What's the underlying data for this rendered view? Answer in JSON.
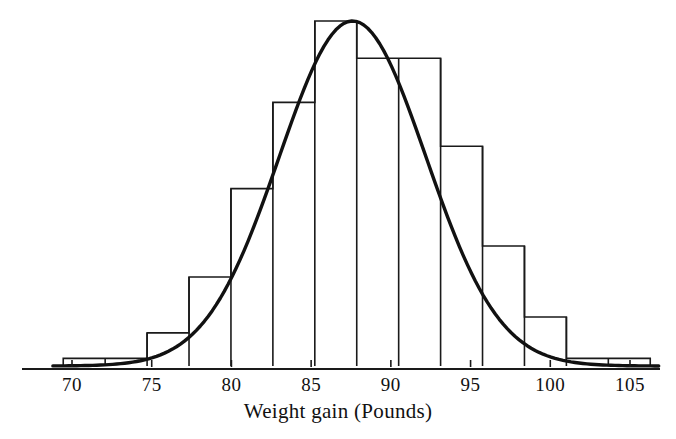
{
  "chart_data": {
    "type": "bar",
    "title": "",
    "subtitle": "",
    "xlabel": "Weight gain (Pounds)",
    "ylabel": "",
    "grid": false,
    "legend": null,
    "xlim": [
      68.8,
      106.9
    ],
    "ylim": [
      0,
      1.0
    ],
    "xticks": [
      70,
      75,
      80,
      85,
      90,
      95,
      100,
      105
    ],
    "xticklabels": [
      "70",
      "75",
      "80",
      "85",
      "90",
      "95",
      "100",
      "105"
    ],
    "yticks": [],
    "yticklabels": [],
    "bin_width": 2.63,
    "bin_edges": [
      69.45,
      72.08,
      74.71,
      77.34,
      79.97,
      82.6,
      85.23,
      87.86,
      90.49,
      93.12,
      95.75,
      98.38,
      101.01,
      103.64,
      106.27
    ],
    "categories": [
      "69.5-72.1",
      "72.1-74.7",
      "74.7-77.3",
      "77.3-80.0",
      "80.0-82.6",
      "82.6-85.2",
      "85.2-87.9",
      "87.9-90.5",
      "90.5-93.1",
      "93.1-95.8",
      "95.8-98.4",
      "98.4-101.0",
      "101.0-103.6",
      "103.6-106.3"
    ],
    "values": [
      0.022,
      0.022,
      0.096,
      0.258,
      0.514,
      0.764,
      1.0,
      0.892,
      0.892,
      0.637,
      0.348,
      0.142,
      0.022,
      0.022
    ],
    "curve": {
      "name": "normal density overlay",
      "mean": 87.6,
      "sigma": 4.6,
      "peak_value": 1.0
    },
    "annotations": []
  },
  "axis": {
    "line_color": "#1a1a1a",
    "tick_color": "#1a1a1a"
  },
  "style": {
    "bar_edge_color": "#1a1a1a",
    "bar_fill_color": "#ffffff",
    "curve_color": "#111111",
    "text_color": "#111111"
  }
}
